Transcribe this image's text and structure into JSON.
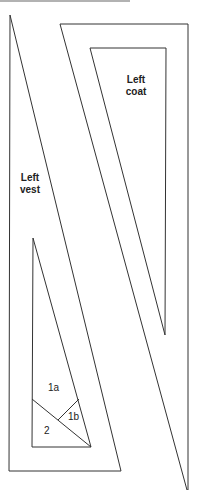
{
  "diagram": {
    "pieces": [
      {
        "name": "left-coat",
        "label_line1": "Left",
        "label_line2": "coat"
      },
      {
        "name": "left-vest",
        "label_line1": "Left",
        "label_line2": "vest"
      }
    ],
    "sections": [
      "1a",
      "1b",
      "2"
    ],
    "line_color": "#333333",
    "rule_color": "#999999"
  }
}
